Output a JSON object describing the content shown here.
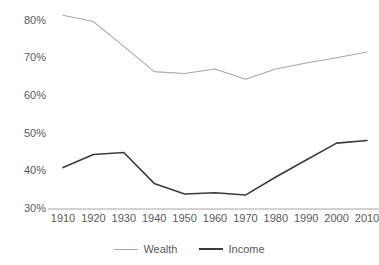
{
  "chart_data": {
    "type": "line",
    "title": "",
    "subtitle": "",
    "xlabel": "",
    "ylabel": "",
    "categories": [
      "1910",
      "1920",
      "1930",
      "1940",
      "1950",
      "1960",
      "1970",
      "1980",
      "1990",
      "2000",
      "2010"
    ],
    "x": [
      1910,
      1920,
      1930,
      1940,
      1950,
      1960,
      1970,
      1980,
      1990,
      2000,
      2010
    ],
    "series": [
      {
        "name": "Wealth",
        "color": "#A6A6A6",
        "values": [
          81.5,
          79.8,
          73.2,
          66.5,
          66.0,
          67.2,
          64.5,
          67.2,
          68.8,
          70.2,
          71.7
        ]
      },
      {
        "name": "Income",
        "color": "#3B3B3B",
        "values": [
          41.0,
          44.5,
          45.0,
          36.8,
          34.0,
          34.3,
          33.7,
          38.5,
          43.0,
          47.5,
          48.2
        ]
      }
    ],
    "ylim": [
      30,
      85
    ],
    "yticks": [
      30,
      40,
      50,
      60,
      70,
      80
    ],
    "ytick_labels": [
      "30%",
      "40%",
      "50%",
      "60%",
      "70%",
      "80%"
    ],
    "grid": false,
    "axis_line_color": "#A6A6A6",
    "legend_position": "bottom"
  }
}
